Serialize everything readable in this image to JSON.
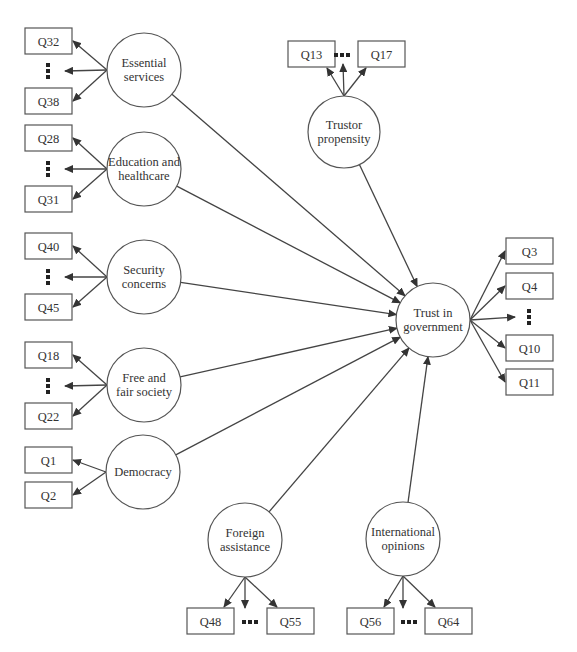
{
  "diagram": {
    "colors": {
      "stroke": "#555555",
      "arrow": "#444444",
      "text": "#333333",
      "background": "#ffffff"
    },
    "central": {
      "id": "trust",
      "label_lines": [
        "Trust in",
        "government"
      ],
      "cx": 433,
      "cy": 320,
      "r": 37,
      "indicators": [
        {
          "label": "Q3",
          "x": 506,
          "y": 238
        },
        {
          "label": "Q4",
          "x": 506,
          "y": 273
        },
        {
          "label": "Q10",
          "x": 506,
          "y": 335
        },
        {
          "label": "Q11",
          "x": 506,
          "y": 369
        }
      ],
      "ellipsis": {
        "x": 529,
        "y": 317,
        "orientation": "vertical"
      }
    },
    "constructs": [
      {
        "id": "essential",
        "label_lines": [
          "Essential",
          "services"
        ],
        "cx": 144,
        "cy": 70,
        "r": 37,
        "indicators": [
          {
            "label": "Q32",
            "x": 25,
            "y": 28
          },
          {
            "label": "Q38",
            "x": 25,
            "y": 88
          }
        ],
        "ellipsis": {
          "x": 48,
          "y": 71,
          "orientation": "vertical"
        }
      },
      {
        "id": "education",
        "label_lines": [
          "Education and",
          "healthcare"
        ],
        "cx": 144,
        "cy": 169,
        "r": 37,
        "indicators": [
          {
            "label": "Q28",
            "x": 25,
            "y": 125
          },
          {
            "label": "Q31",
            "x": 25,
            "y": 186
          }
        ],
        "ellipsis": {
          "x": 48,
          "y": 169,
          "orientation": "vertical"
        }
      },
      {
        "id": "security",
        "label_lines": [
          "Security",
          "concerns"
        ],
        "cx": 144,
        "cy": 277,
        "r": 37,
        "indicators": [
          {
            "label": "Q40",
            "x": 25,
            "y": 233
          },
          {
            "label": "Q45",
            "x": 25,
            "y": 294
          }
        ],
        "ellipsis": {
          "x": 48,
          "y": 277,
          "orientation": "vertical"
        }
      },
      {
        "id": "free_fair",
        "label_lines": [
          "Free and",
          "fair society"
        ],
        "cx": 144,
        "cy": 385,
        "r": 37,
        "indicators": [
          {
            "label": "Q18",
            "x": 25,
            "y": 342
          },
          {
            "label": "Q22",
            "x": 25,
            "y": 403
          }
        ],
        "ellipsis": {
          "x": 48,
          "y": 386,
          "orientation": "vertical"
        }
      },
      {
        "id": "democracy",
        "label_lines": [
          "Democracy"
        ],
        "cx": 143,
        "cy": 472,
        "r": 37,
        "indicators": [
          {
            "label": "Q1",
            "x": 25,
            "y": 447
          },
          {
            "label": "Q2",
            "x": 25,
            "y": 482
          }
        ],
        "ellipsis": null
      },
      {
        "id": "trustor",
        "label_lines": [
          "Trustor",
          "propensity"
        ],
        "cx": 344,
        "cy": 132,
        "r": 36,
        "indicators": [
          {
            "label": "Q13",
            "x": 288,
            "y": 41
          },
          {
            "label": "Q17",
            "x": 358,
            "y": 41
          }
        ],
        "ellipsis": {
          "x": 342,
          "y": 55,
          "orientation": "horizontal"
        }
      },
      {
        "id": "foreign",
        "label_lines": [
          "Foreign",
          "assistance"
        ],
        "cx": 245,
        "cy": 540,
        "r": 37,
        "indicators": [
          {
            "label": "Q48",
            "x": 187,
            "y": 608
          },
          {
            "label": "Q55",
            "x": 267,
            "y": 608
          }
        ],
        "ellipsis": {
          "x": 250,
          "y": 622,
          "orientation": "horizontal"
        }
      },
      {
        "id": "international",
        "label_lines": [
          "International",
          "opinions"
        ],
        "cx": 403,
        "cy": 539,
        "r": 37,
        "indicators": [
          {
            "label": "Q56",
            "x": 347,
            "y": 608
          },
          {
            "label": "Q64",
            "x": 425,
            "y": 608
          }
        ],
        "ellipsis": {
          "x": 409,
          "y": 622,
          "orientation": "horizontal"
        }
      }
    ],
    "box": {
      "width": 47,
      "height": 26
    }
  }
}
